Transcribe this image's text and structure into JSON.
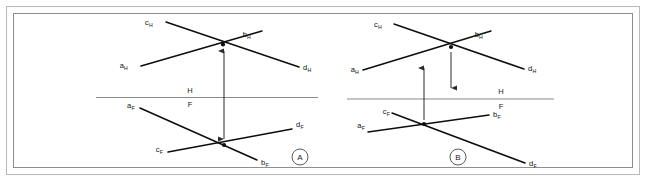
{
  "figure": {
    "background_color": "#ffffff",
    "line_color": "#0d0d0d",
    "reference_line_color": "#8a8a8a",
    "frame_color": "#b9b9b9"
  },
  "reference_planes": {
    "upper_label": "H",
    "lower_label": "F"
  },
  "panels": [
    {
      "id": "A",
      "badge_label": "A",
      "description": "Lines appear to intersect in both views but projectors do not align at a common point",
      "horizontal_view": {
        "labels": [
          {
            "name": "c_H",
            "text": "c",
            "sub": "H"
          },
          {
            "name": "b_H",
            "text": "b",
            "sub": "H"
          },
          {
            "name": "a_H",
            "text": "a",
            "sub": "H"
          },
          {
            "name": "d_H",
            "text": "d",
            "sub": "H"
          }
        ]
      },
      "frontal_view": {
        "labels": [
          {
            "name": "a_F",
            "text": "a",
            "sub": "F"
          },
          {
            "name": "d_F",
            "text": "d",
            "sub": "F"
          },
          {
            "name": "c_F",
            "text": "c",
            "sub": "F"
          },
          {
            "name": "b_F",
            "text": "b",
            "sub": "F"
          }
        ]
      },
      "projector_count": 1
    },
    {
      "id": "B",
      "badge_label": "B",
      "description": "Crossing points in H and F views are not on the same projector",
      "horizontal_view": {
        "labels": [
          {
            "name": "c_H",
            "text": "c",
            "sub": "H"
          },
          {
            "name": "b_H",
            "text": "b",
            "sub": "H"
          },
          {
            "name": "a_H",
            "text": "a",
            "sub": "H"
          },
          {
            "name": "d_H",
            "text": "d",
            "sub": "H"
          }
        ]
      },
      "frontal_view": {
        "labels": [
          {
            "name": "c_F",
            "text": "c",
            "sub": "F"
          },
          {
            "name": "b_F",
            "text": "b",
            "sub": "F"
          },
          {
            "name": "a_F",
            "text": "a",
            "sub": "F"
          },
          {
            "name": "d_F",
            "text": "d",
            "sub": "F"
          }
        ]
      },
      "projector_count": 2
    }
  ]
}
